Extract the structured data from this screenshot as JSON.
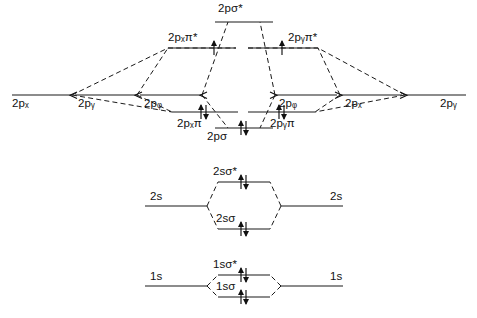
{
  "diagram": {
    "molecule": "O2",
    "background_color": "#ffffff",
    "line_color": "#1a1a1a",
    "text_color": "#111111"
  },
  "labels": {
    "p_sigma_star": "2pσ*",
    "px_pi_star": "2pₓπ*",
    "py_pi_star": "2pᵧπ*",
    "px_pi": "2pₓπ",
    "py_pi": "2pᵧπ",
    "p_sigma": "2pσ",
    "left_2px": "2pₓ",
    "left_2py": "2pᵧ",
    "left_2pz": "2pᵩ",
    "right_2pz": "2pᵩ",
    "right_2px": "2pₓ",
    "right_2py": "2pᵧ",
    "left_2s": "2s",
    "right_2s": "2s",
    "s2_sigma_star": "2sσ*",
    "s2_sigma": "2sσ",
    "left_1s": "1s",
    "right_1s": "1s",
    "s1_sigma_star": "1sσ*",
    "s1_sigma": "1sσ"
  },
  "label_parts": {
    "p_sigma_star": {
      "base": "2pσ",
      "sub": "",
      "star": "*"
    },
    "px_pi_star": {
      "base": "2p",
      "sub": "x",
      "tail": "π",
      "star": "*"
    },
    "py_pi_star": {
      "base": "2p",
      "sub": "y",
      "tail": "π",
      "star": "*"
    },
    "px_pi": {
      "base": "2p",
      "sub": "x",
      "tail": "π",
      "star": ""
    },
    "py_pi": {
      "base": "2p",
      "sub": "y",
      "tail": "π",
      "star": ""
    },
    "p_sigma": {
      "base": "2pσ",
      "sub": "",
      "star": ""
    }
  },
  "atomic_levels": {
    "left": [
      {
        "name": "2p",
        "sub": "x",
        "x1": 12,
        "x2": 72,
        "y": 95
      },
      {
        "name": "2p",
        "sub": "y",
        "x1": 75,
        "x2": 137,
        "y": 95
      },
      {
        "name": "2p",
        "sub": "z",
        "x1": 140,
        "x2": 202,
        "y": 95
      }
    ],
    "right": [
      {
        "name": "2p",
        "sub": "z",
        "x1": 275,
        "x2": 337,
        "y": 95
      },
      {
        "name": "2p",
        "sub": "x",
        "x1": 340,
        "x2": 402,
        "y": 95
      },
      {
        "name": "2p",
        "sub": "y",
        "x1": 405,
        "x2": 466,
        "y": 95
      }
    ]
  },
  "molecular_levels": [
    {
      "id": "2p-sigma-star",
      "label": "2pσ*",
      "x1": 215,
      "x2": 273,
      "y": 22,
      "electrons": 0
    },
    {
      "id": "2px-pi-star",
      "label": "2pₓπ*",
      "x1": 168,
      "x2": 236,
      "y": 48,
      "electrons": 1,
      "spins": [
        "up"
      ]
    },
    {
      "id": "2py-pi-star",
      "label": "2pᵧπ*",
      "x1": 248,
      "x2": 318,
      "y": 48,
      "electrons": 1,
      "spins": [
        "up"
      ]
    },
    {
      "id": "2px-pi",
      "label": "2pₓπ",
      "x1": 172,
      "x2": 238,
      "y": 112,
      "electrons": 2,
      "spins": [
        "up",
        "down"
      ]
    },
    {
      "id": "2py-pi",
      "label": "2pᵧπ",
      "x1": 248,
      "x2": 315,
      "y": 112,
      "electrons": 2,
      "spins": [
        "up",
        "down"
      ]
    },
    {
      "id": "2p-sigma",
      "label": "2pσ",
      "x1": 215,
      "x2": 273,
      "y": 128,
      "electrons": 2,
      "spins": [
        "up",
        "down"
      ]
    },
    {
      "id": "2s-sigma-star",
      "label": "2sσ*",
      "x1": 218,
      "x2": 270,
      "y": 182,
      "electrons": 2,
      "spins": [
        "up",
        "down"
      ]
    },
    {
      "id": "2s-sigma",
      "label": "2sσ",
      "x1": 218,
      "x2": 270,
      "y": 229,
      "electrons": 2,
      "spins": [
        "up",
        "down"
      ]
    },
    {
      "id": "1s-sigma-star",
      "label": "1sσ*",
      "x1": 218,
      "x2": 270,
      "y": 275,
      "electrons": 2,
      "spins": [
        "up",
        "down"
      ]
    },
    {
      "id": "1s-sigma",
      "label": "1sσ",
      "x1": 218,
      "x2": 270,
      "y": 297,
      "electrons": 2,
      "spins": [
        "up",
        "down"
      ]
    }
  ],
  "s_shells": [
    {
      "id": "2s-shell",
      "left_label": "2s",
      "right_label": "2s",
      "left_x1": 145,
      "left_x2": 207,
      "left_y": 206,
      "right_x1": 281,
      "right_x2": 343,
      "right_y": 206,
      "bonding_y": 229,
      "antibonding_y": 182
    },
    {
      "id": "1s-shell",
      "left_label": "1s",
      "right_label": "1s",
      "left_x1": 145,
      "left_x2": 207,
      "left_y": 286,
      "right_x1": 281,
      "right_x2": 343,
      "right_y": 286,
      "bonding_y": 297,
      "antibonding_y": 275
    }
  ],
  "electron_notation": {
    "up_arrow": "↑",
    "down_arrow": "↓",
    "pair": "↑↓"
  }
}
